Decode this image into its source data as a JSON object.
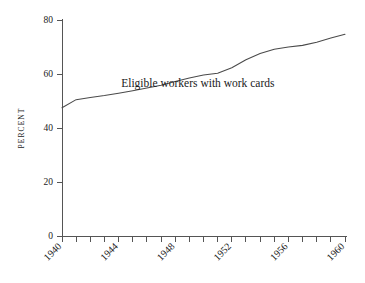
{
  "chart_data": {
    "type": "line",
    "title": "",
    "subtitle": "",
    "xlabel": "",
    "ylabel": "PERCENT",
    "xlim": [
      1940,
      1960
    ],
    "ylim": [
      0,
      80
    ],
    "grid": false,
    "legend_position": "none",
    "y_ticks": [
      0,
      20,
      40,
      60,
      80
    ],
    "y_tick_labels": [
      "0",
      "20",
      "40",
      "60",
      "80"
    ],
    "x_ticks_minor": [
      1940,
      1941,
      1942,
      1943,
      1944,
      1945,
      1946,
      1947,
      1948,
      1949,
      1950,
      1951,
      1952,
      1953,
      1954,
      1955,
      1956,
      1957,
      1958,
      1959,
      1960
    ],
    "x_tick_labels": [
      "1940",
      "1944",
      "1948",
      "1952",
      "1956",
      "1960"
    ],
    "x_tick_label_years": [
      1940,
      1944,
      1948,
      1952,
      1956,
      1960
    ],
    "x_tick_label_rotation": -45,
    "annotations": [
      {
        "text": "Eligible workers with work cards",
        "x": 1949.6,
        "y": 55.3
      }
    ],
    "series": [
      {
        "name": "Eligible workers with work cards",
        "color": "#4a4a4a",
        "x": [
          1940,
          1941,
          1942,
          1943,
          1944,
          1945,
          1946,
          1947,
          1948,
          1949,
          1950,
          1951,
          1952,
          1953,
          1954,
          1955,
          1956,
          1957,
          1958,
          1959,
          1960
        ],
        "values": [
          47.5,
          50.5,
          51.3,
          52.0,
          52.9,
          53.8,
          54.8,
          55.8,
          57.2,
          58.5,
          59.6,
          60.3,
          62.3,
          65.3,
          67.6,
          69.2,
          70.0,
          70.6,
          71.8,
          73.3,
          74.7
        ]
      }
    ]
  },
  "axis_labels": {
    "y_title": "PERCENT"
  },
  "colors": {
    "line": "#4a4a4a",
    "axis": "#555555",
    "text": "#1a1a1a",
    "background": "#ffffff"
  }
}
